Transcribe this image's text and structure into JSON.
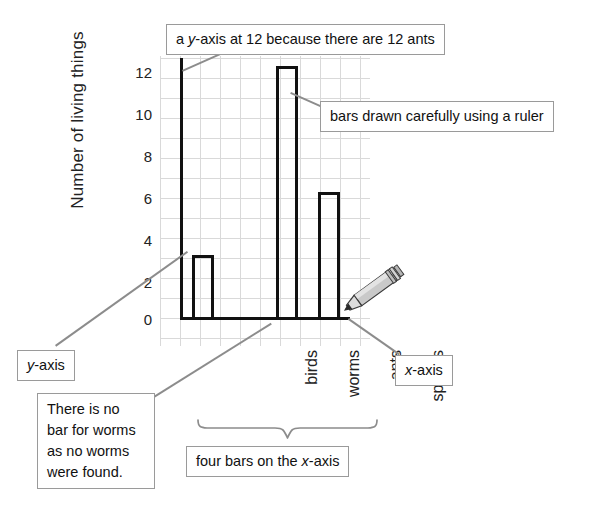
{
  "chart_data": {
    "type": "bar",
    "title": "",
    "xlabel": "",
    "ylabel": "Number of living things",
    "categories": [
      "birds",
      "worms",
      "ants",
      "spiders"
    ],
    "values": [
      3,
      0,
      12,
      6
    ],
    "ylim": [
      0,
      12
    ],
    "yticks": [
      "0",
      "2",
      "4",
      "6",
      "8",
      "10",
      "12"
    ],
    "ytick_values": [
      0,
      2,
      4,
      6,
      8,
      10,
      12
    ],
    "grid": true,
    "grid_minor": true,
    "legend": null,
    "bar_fill": "none",
    "bar_edge_color": "#111111",
    "grid_color": "#d9d9d9",
    "annotations": [
      "a y-axis at 12 because there are 12 ants",
      "bars drawn carefully using a ruler",
      "y-axis",
      "x-axis",
      "There is no bar for worms as no worms were found.",
      "four bars on the x-axis"
    ]
  },
  "callouts": {
    "yaxis_top": {
      "pre": "a ",
      "italic": "y",
      "post": "-axis at 12 because there are 12 ants"
    },
    "ruler": {
      "text": "bars drawn carefully using a ruler"
    },
    "yaxis_label": {
      "italic": "y",
      "post": "-axis"
    },
    "xaxis_label": {
      "italic": "x",
      "post": "-axis"
    },
    "no_worms": {
      "line1": "There is no",
      "line2": "bar for worms",
      "line3": "as no worms",
      "line4": "were found."
    },
    "four_bars": {
      "pre": "four bars on the ",
      "italic": "x",
      "post": "-axis"
    }
  },
  "icons": {
    "pencil": "pencil-icon",
    "brace": "curly-brace-icon"
  },
  "colors": {
    "axis": "#111111",
    "grid": "#d9d9d9",
    "leader": "#8c8c8c",
    "callout_border": "#9a9a9a",
    "pencil_body": "#c9c9c9",
    "background": "#ffffff"
  }
}
